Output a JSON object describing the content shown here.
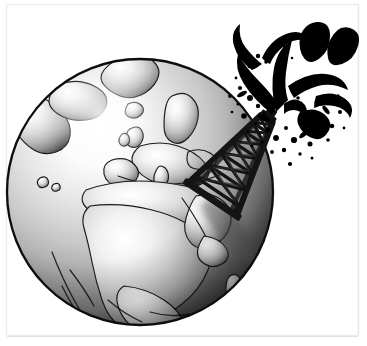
{
  "canvas": {
    "width": 367,
    "height": 346,
    "background_color": "#ffffff",
    "title": "Oil derrick gushing crude oil on planet Earth",
    "style": "grayscale pen-and-ink clip-art illustration",
    "border": {
      "visible": true,
      "color": "#e8e8e8",
      "inset_left": 6,
      "inset_top": 4,
      "inset_right": 9,
      "inset_bottom": 10
    }
  },
  "scene": {
    "caption": "Black oil spouts from a lattice derrick planted in the Middle East on a shaded globe",
    "objects": [
      {
        "name": "globe",
        "label": "Planet Earth"
      },
      {
        "name": "oil-derrick",
        "label": "Oil drilling derrick"
      },
      {
        "name": "oil-gusher",
        "label": "Crude oil gusher"
      },
      {
        "name": "derrick-shadow",
        "label": "Cast shadow of derrick"
      }
    ]
  },
  "globe": {
    "label": "Earth globe",
    "center_x": 140,
    "center_y": 192,
    "radius": 133,
    "outline_color": "#0d0d0d",
    "outline_width": 2.2,
    "ocean": {
      "highlight_color": "#fdfdfd",
      "mid_color": "#b9b9b9",
      "shadow_color": "#3a3a3a",
      "deep_shadow_color": "#141414",
      "light_x": 104,
      "light_y": 116
    },
    "land": {
      "fill_color": "#cfcfcf",
      "stroke_color": "#1a1a1a",
      "stroke_width": 1.2
    },
    "landmasses": [
      "Greenland",
      "Iceland",
      "Scandinavia",
      "British Isles",
      "Europe",
      "Mediterranean Sea",
      "North Africa",
      "Sub-Saharan Africa",
      "Arabian Peninsula",
      "Middle East",
      "Madagascar"
    ]
  },
  "derrick": {
    "label": "Oil derrick tower",
    "color": "#141414",
    "base_x": 212,
    "base_y": 200,
    "tip_x": 273,
    "tip_y": 112,
    "tilt_degrees": 34,
    "lattice_rungs": 7,
    "structure": "tapered four-leg steel lattice with X cross-bracing"
  },
  "gusher": {
    "label": "Oil gusher spray",
    "color": "#000000",
    "origin_x": 276,
    "origin_y": 110,
    "plume_count": 7,
    "droplet_count": 52,
    "description": "Comma and teardrop shaped jets fanning up and right with scattered round droplets"
  },
  "shadow": {
    "label": "Derrick shadow on globe",
    "color": "#6a6a6a",
    "opacity": 0.55
  },
  "palette": {
    "ink": "#0d0d0d",
    "oil_black": "#000000",
    "land_gray": "#cfcfcf",
    "ocean_light": "#fdfdfd",
    "ocean_mid": "#b9b9b9",
    "ocean_dark": "#2a2a2a",
    "paper": "#ffffff",
    "border_gray": "#e8e8e8"
  }
}
